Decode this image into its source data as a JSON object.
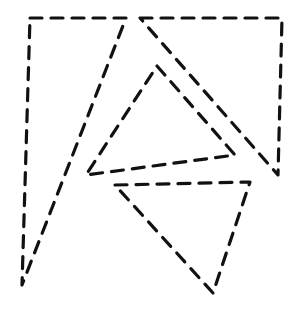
{
  "canvas": {
    "width": 302,
    "height": 321,
    "background": "#ffffff",
    "stroke_color": "#111111"
  },
  "shapes": [
    {
      "name": "tall-left-triangle",
      "points": "30,18 126,18 22,285"
    },
    {
      "name": "top-right-triangle",
      "points": "140,18 282,18 278,175"
    },
    {
      "name": "middle-triangle",
      "points": "157,66 235,155 86,175"
    },
    {
      "name": "bottom-triangle",
      "points": "115,185 250,182 213,293"
    }
  ]
}
